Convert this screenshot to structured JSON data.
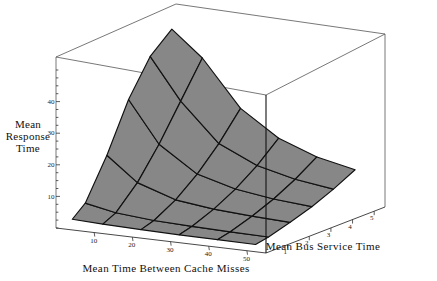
{
  "figure": {
    "kind": "3d-surface-plot",
    "background_color": "#ffffff",
    "line_color": "#1a1a1a",
    "box_color": "#555555",
    "surface_fill": "#878787",
    "surface_edge": "#111111"
  },
  "axes": {
    "z": {
      "title_lines": [
        "Mean",
        "Response",
        "Time"
      ],
      "ticks": [
        10,
        20,
        30,
        40
      ],
      "tick_labels": [
        "10",
        "20",
        "30",
        "40"
      ],
      "range": [
        0,
        50
      ]
    },
    "x": {
      "title": "Mean Time Between Cache Misses",
      "ticks": [
        10,
        20,
        30,
        40,
        50
      ],
      "tick_labels": [
        "10",
        "20",
        "30",
        "40",
        "50"
      ],
      "range": [
        0,
        55
      ]
    },
    "y": {
      "title": "Mean Bus Service Time",
      "ticks": [
        1,
        2,
        3,
        4,
        5
      ],
      "tick_labels": [
        "1",
        "2",
        "3",
        "4",
        "5"
      ],
      "range": [
        0,
        5.5
      ]
    }
  },
  "chart_data": {
    "type": "surface",
    "title": "",
    "xlabel": "Mean Time Between Cache Misses",
    "ylabel": "Mean Bus Service Time",
    "zlabel": "Mean Response Time",
    "xlim": [
      0,
      55
    ],
    "ylim": [
      0,
      5.5
    ],
    "zlim": [
      0,
      50
    ],
    "grid": true,
    "legend": "none",
    "x": [
      2,
      10,
      20,
      30,
      40,
      50
    ],
    "y": [
      0.4,
      1,
      2,
      3,
      4,
      5
    ],
    "z_note": "z = Mean Response Time; rows indexed by y (Mean Bus Service Time), columns by x (Mean Time Between Cache Misses). Surface rises steeply as Mean Time Between Cache Misses decreases and as Mean Bus Service Time increases.",
    "z": [
      [
        2.0,
        1.6,
        1.3,
        1.1,
        1.0,
        0.9
      ],
      [
        5.5,
        3.6,
        2.6,
        2.2,
        1.9,
        1.7
      ],
      [
        18.0,
        10.5,
        6.5,
        5.0,
        4.2,
        3.7
      ],
      [
        33.0,
        20.0,
        12.0,
        8.7,
        7.0,
        6.0
      ],
      [
        44.0,
        31.0,
        19.0,
        13.5,
        10.6,
        8.9
      ],
      [
        50.0,
        42.0,
        27.5,
        19.5,
        15.0,
        12.4
      ]
    ]
  },
  "projection": {
    "note": "2-D pixel coordinates of the drawing box corners used to render the isometric view",
    "box": {
      "top_back": [
        176,
        4
      ],
      "top_left": [
        56,
        57
      ],
      "top_right": [
        385,
        34
      ],
      "top_front": [
        266,
        95
      ],
      "bottom_left": [
        56,
        228
      ],
      "bottom_front": [
        266,
        253
      ],
      "bottom_right": [
        385,
        207
      ]
    }
  }
}
